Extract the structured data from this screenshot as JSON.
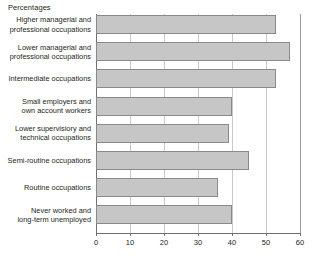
{
  "chart": {
    "title": "Percentages",
    "axis_label_color": "#231f20",
    "bar_fill": "#c6c6c6",
    "bar_stroke": "#8a8a8a",
    "grid_color": "#c9c9c9",
    "axis_color": "#6f6f6f"
  },
  "chart_data": {
    "type": "bar",
    "orientation": "horizontal",
    "title": "Percentages",
    "xlabel": "",
    "ylabel": "",
    "xlim": [
      0,
      60
    ],
    "xticks": [
      0,
      10,
      20,
      30,
      40,
      50,
      60
    ],
    "xticklabels": [
      "0",
      "10",
      "20",
      "30",
      "40",
      "50",
      "60"
    ],
    "grid": true,
    "legend": null,
    "categories": [
      "Higher managerial and\nprofessional occupations",
      "Lower managerial and\nprofessional occupations",
      "Intermediate occupations",
      "Small employers and\nown account workers",
      "Lower supervisiory and\ntechnical occupations",
      "Semi-routine occupations",
      "Routine occupations",
      "Never worked and\nlong-term unemployed"
    ],
    "values": [
      53,
      57,
      53,
      40,
      39,
      45,
      36,
      40
    ]
  }
}
